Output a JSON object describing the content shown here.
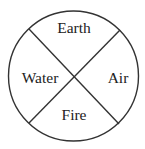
{
  "diagram": {
    "type": "circle-divided-into-four-quadrants",
    "colors": {
      "background": "#ffffff",
      "stroke": "#333333",
      "text": "#222222"
    },
    "quadrants": {
      "top": {
        "label": "Earth"
      },
      "left": {
        "label": "Water"
      },
      "right": {
        "label": "Air"
      },
      "bottom": {
        "label": "Fire"
      }
    }
  }
}
